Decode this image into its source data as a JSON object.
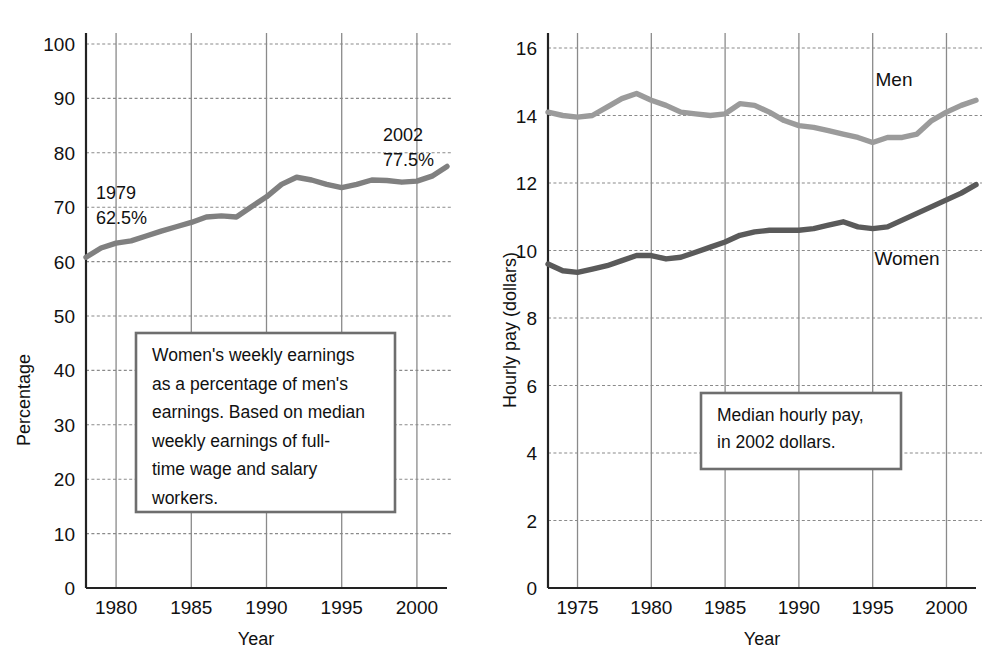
{
  "figure": {
    "background": "#ffffff",
    "ink": "#111111",
    "grid_color": "#8a8a8a",
    "axis_color": "#222222",
    "callout_border": "#6e6e6e"
  },
  "charts": [
    {
      "id": "womens-earnings-percentage",
      "type": "line",
      "title": "",
      "xlabel": "Year",
      "ylabel": "Percentage",
      "xlim": [
        1978,
        2002
      ],
      "ylim": [
        0,
        105
      ],
      "xticks": [
        1980,
        1985,
        1990,
        1995,
        2000
      ],
      "xtick_labels": [
        "1980",
        "1985",
        "1990",
        "1995",
        "2000"
      ],
      "yticks": [
        0,
        10,
        20,
        30,
        40,
        50,
        60,
        70,
        80,
        90,
        100
      ],
      "ytick_labels": [
        "0",
        "10",
        "20",
        "30",
        "40",
        "50",
        "60",
        "70",
        "80",
        "90",
        "100"
      ],
      "grid": true,
      "legend": "none",
      "line_color": "#808080",
      "series": [
        {
          "name": "Women's weekly earnings as a percentage of men's",
          "color": "#808080",
          "x": [
            1978,
            1979,
            1980,
            1981,
            1982,
            1983,
            1984,
            1985,
            1986,
            1987,
            1988,
            1989,
            1990,
            1991,
            1992,
            1993,
            1994,
            1995,
            1996,
            1997,
            1998,
            1999,
            2000,
            2001,
            2002
          ],
          "values": [
            60.8,
            62.5,
            63.4,
            63.8,
            64.7,
            65.6,
            66.4,
            67.2,
            68.2,
            68.4,
            68.2,
            70.1,
            71.9,
            74.2,
            75.5,
            75.0,
            74.2,
            73.6,
            74.2,
            75.0,
            74.9,
            74.6,
            74.8,
            75.7,
            77.5
          ]
        }
      ],
      "annotations": [
        {
          "id": "start-point",
          "year": "1979",
          "value": "62.5%",
          "x": 1979,
          "y": 62.5
        },
        {
          "id": "end-point",
          "year": "2002",
          "value": "77.5%",
          "x": 2002,
          "y": 77.5
        }
      ],
      "callout": {
        "lines": [
          "Women's weekly earnings",
          "as a percentage of men's",
          "earnings. Based on median",
          "weekly earnings of full-",
          "time wage and salary",
          "workers."
        ]
      }
    },
    {
      "id": "median-hourly-pay",
      "type": "line",
      "title": "",
      "xlabel": "Year",
      "ylabel": "Hourly pay (dollars)",
      "xlim": [
        1973,
        2002
      ],
      "ylim": [
        0,
        17
      ],
      "xticks": [
        1975,
        1980,
        1985,
        1990,
        1995,
        2000
      ],
      "xtick_labels": [
        "1975",
        "1980",
        "1985",
        "1990",
        "1995",
        "2000"
      ],
      "yticks": [
        0,
        2,
        4,
        6,
        8,
        10,
        12,
        14,
        16
      ],
      "ytick_labels": [
        "0",
        "2",
        "4",
        "6",
        "8",
        "10",
        "12",
        "14",
        "16"
      ],
      "grid": true,
      "legend": "inline-labels",
      "series": [
        {
          "name": "Men",
          "label": "Men",
          "color": "#9b9b9b",
          "x": [
            1973,
            1974,
            1975,
            1976,
            1977,
            1978,
            1979,
            1980,
            1981,
            1982,
            1983,
            1984,
            1985,
            1986,
            1987,
            1988,
            1989,
            1990,
            1991,
            1992,
            1993,
            1994,
            1995,
            1996,
            1997,
            1998,
            1999,
            2000,
            2001,
            2002
          ],
          "values": [
            14.1,
            14.0,
            13.95,
            14.0,
            14.25,
            14.5,
            14.65,
            14.45,
            14.3,
            14.1,
            14.05,
            14.0,
            14.05,
            14.35,
            14.3,
            14.1,
            13.85,
            13.7,
            13.65,
            13.55,
            13.45,
            13.35,
            13.2,
            13.35,
            13.35,
            13.45,
            13.85,
            14.1,
            14.3,
            14.45
          ]
        },
        {
          "name": "Women",
          "label": "Women",
          "color": "#5a5a5a",
          "x": [
            1973,
            1974,
            1975,
            1976,
            1977,
            1978,
            1979,
            1980,
            1981,
            1982,
            1983,
            1984,
            1985,
            1986,
            1987,
            1988,
            1989,
            1990,
            1991,
            1992,
            1993,
            1994,
            1995,
            1996,
            1997,
            1998,
            1999,
            2000,
            2001,
            2002
          ],
          "values": [
            9.6,
            9.4,
            9.35,
            9.45,
            9.55,
            9.7,
            9.85,
            9.85,
            9.75,
            9.8,
            9.95,
            10.1,
            10.25,
            10.45,
            10.55,
            10.6,
            10.6,
            10.6,
            10.65,
            10.75,
            10.85,
            10.7,
            10.65,
            10.7,
            10.9,
            11.1,
            11.3,
            11.5,
            11.7,
            11.95
          ]
        }
      ],
      "callout": {
        "lines": [
          "Median hourly pay,",
          "in 2002 dollars."
        ]
      }
    }
  ]
}
